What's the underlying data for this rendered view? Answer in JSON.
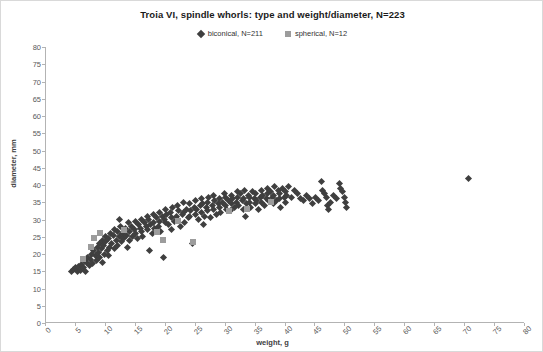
{
  "chart_data": {
    "type": "scatter",
    "title": "Troia VI, spindle whorls: type and weight/diameter, N=223",
    "xlabel": "weight, g",
    "ylabel": "diameter, mm",
    "xlim": [
      0,
      80
    ],
    "ylim": [
      0,
      80
    ],
    "xticks": [
      0,
      5,
      10,
      15,
      20,
      25,
      30,
      35,
      40,
      45,
      50,
      55,
      60,
      65,
      70,
      75,
      80
    ],
    "yticks": [
      0,
      5,
      10,
      15,
      20,
      25,
      30,
      35,
      40,
      45,
      50,
      55,
      60,
      65,
      70,
      75,
      80
    ],
    "grid": false,
    "legend_position": "top-center",
    "series": [
      {
        "name": "biconical, N=211",
        "marker": "diamond",
        "color": "#3f3f3f",
        "points": [
          [
            4.2,
            15.0
          ],
          [
            4.6,
            15.5
          ],
          [
            5.0,
            16.0
          ],
          [
            5.2,
            14.8
          ],
          [
            5.5,
            16.5
          ],
          [
            5.8,
            15.2
          ],
          [
            6.0,
            17.0
          ],
          [
            6.2,
            16.2
          ],
          [
            6.5,
            18.0
          ],
          [
            6.6,
            15.0
          ],
          [
            6.8,
            17.5
          ],
          [
            7.0,
            19.0
          ],
          [
            7.2,
            16.8
          ],
          [
            7.4,
            18.5
          ],
          [
            7.6,
            20.0
          ],
          [
            7.8,
            17.2
          ],
          [
            8.0,
            21.0
          ],
          [
            8.2,
            19.5
          ],
          [
            8.4,
            18.0
          ],
          [
            8.6,
            22.0
          ],
          [
            8.8,
            20.5
          ],
          [
            9.0,
            23.0
          ],
          [
            9.0,
            19.0
          ],
          [
            9.2,
            21.5
          ],
          [
            9.4,
            24.0
          ],
          [
            9.5,
            17.5
          ],
          [
            9.6,
            22.5
          ],
          [
            9.8,
            20.0
          ],
          [
            10.0,
            25.0
          ],
          [
            10.0,
            23.5
          ],
          [
            10.2,
            21.0
          ],
          [
            10.4,
            24.5
          ],
          [
            10.5,
            19.5
          ],
          [
            10.6,
            22.0
          ],
          [
            10.8,
            26.0
          ],
          [
            11.0,
            23.0
          ],
          [
            11.2,
            25.5
          ],
          [
            11.4,
            21.5
          ],
          [
            11.5,
            27.0
          ],
          [
            11.8,
            24.0
          ],
          [
            12.0,
            26.5
          ],
          [
            12.0,
            22.5
          ],
          [
            12.2,
            25.0
          ],
          [
            12.5,
            28.0
          ],
          [
            12.6,
            23.5
          ],
          [
            12.8,
            26.0
          ],
          [
            13.0,
            24.5
          ],
          [
            13.2,
            27.5
          ],
          [
            13.5,
            25.5
          ],
          [
            13.6,
            22.0
          ],
          [
            13.8,
            29.0
          ],
          [
            14.0,
            26.5
          ],
          [
            14.0,
            24.0
          ],
          [
            14.2,
            28.0
          ],
          [
            14.5,
            25.0
          ],
          [
            14.8,
            27.0
          ],
          [
            15.0,
            29.5
          ],
          [
            15.0,
            26.0
          ],
          [
            15.2,
            24.5
          ],
          [
            15.5,
            28.5
          ],
          [
            15.8,
            27.5
          ],
          [
            16.0,
            30.0
          ],
          [
            16.0,
            26.5
          ],
          [
            16.2,
            25.0
          ],
          [
            16.5,
            29.0
          ],
          [
            16.8,
            28.0
          ],
          [
            17.0,
            31.0
          ],
          [
            17.0,
            27.0
          ],
          [
            17.2,
            30.0
          ],
          [
            17.5,
            28.5
          ],
          [
            17.8,
            26.0
          ],
          [
            18.0,
            31.5
          ],
          [
            18.0,
            29.0
          ],
          [
            18.2,
            27.5
          ],
          [
            18.5,
            30.5
          ],
          [
            18.8,
            28.0
          ],
          [
            19.0,
            32.0
          ],
          [
            19.0,
            29.5
          ],
          [
            19.2,
            26.5
          ],
          [
            19.5,
            31.0
          ],
          [
            19.6,
            19.0
          ],
          [
            19.8,
            30.0
          ],
          [
            20.0,
            33.0
          ],
          [
            20.0,
            29.0
          ],
          [
            20.2,
            31.5
          ],
          [
            20.5,
            28.5
          ],
          [
            20.8,
            32.0
          ],
          [
            21.0,
            30.5
          ],
          [
            21.0,
            27.0
          ],
          [
            21.2,
            33.5
          ],
          [
            21.5,
            29.5
          ],
          [
            21.8,
            31.0
          ],
          [
            22.0,
            34.0
          ],
          [
            22.0,
            30.0
          ],
          [
            22.2,
            32.5
          ],
          [
            22.5,
            28.0
          ],
          [
            22.8,
            31.5
          ],
          [
            23.0,
            35.0
          ],
          [
            23.0,
            32.0
          ],
          [
            23.2,
            29.0
          ],
          [
            23.5,
            33.0
          ],
          [
            23.8,
            30.5
          ],
          [
            24.0,
            34.5
          ],
          [
            24.0,
            31.0
          ],
          [
            24.2,
            32.5
          ],
          [
            24.5,
            23.0
          ],
          [
            24.8,
            33.5
          ],
          [
            25.0,
            35.5
          ],
          [
            25.0,
            31.5
          ],
          [
            25.2,
            33.0
          ],
          [
            25.5,
            30.0
          ],
          [
            25.8,
            34.0
          ],
          [
            26.0,
            36.0
          ],
          [
            26.0,
            32.0
          ],
          [
            26.2,
            34.5
          ],
          [
            26.5,
            31.0
          ],
          [
            26.8,
            33.5
          ],
          [
            27.0,
            35.0
          ],
          [
            27.0,
            32.5
          ],
          [
            27.2,
            36.5
          ],
          [
            27.5,
            30.5
          ],
          [
            27.8,
            34.0
          ],
          [
            28.0,
            37.0
          ],
          [
            28.0,
            33.0
          ],
          [
            28.2,
            35.5
          ],
          [
            28.5,
            31.5
          ],
          [
            28.8,
            34.5
          ],
          [
            29.0,
            36.0
          ],
          [
            29.0,
            33.5
          ],
          [
            29.2,
            32.0
          ],
          [
            29.5,
            35.0
          ],
          [
            29.8,
            37.5
          ],
          [
            30.0,
            34.0
          ],
          [
            30.0,
            36.5
          ],
          [
            30.2,
            33.0
          ],
          [
            30.5,
            35.5
          ],
          [
            30.8,
            32.5
          ],
          [
            31.0,
            37.0
          ],
          [
            31.0,
            34.5
          ],
          [
            31.2,
            36.0
          ],
          [
            31.5,
            33.5
          ],
          [
            31.8,
            35.0
          ],
          [
            32.0,
            38.0
          ],
          [
            32.0,
            36.5
          ],
          [
            32.2,
            34.0
          ],
          [
            32.5,
            37.5
          ],
          [
            32.8,
            35.5
          ],
          [
            33.0,
            33.0
          ],
          [
            33.0,
            36.0
          ],
          [
            33.2,
            38.5
          ],
          [
            33.5,
            34.5
          ],
          [
            33.8,
            37.0
          ],
          [
            34.0,
            35.0
          ],
          [
            34.0,
            36.5
          ],
          [
            34.2,
            33.5
          ],
          [
            34.5,
            38.0
          ],
          [
            34.8,
            36.0
          ],
          [
            35.0,
            37.5
          ],
          [
            35.0,
            34.5
          ],
          [
            35.2,
            35.5
          ],
          [
            35.5,
            33.0
          ],
          [
            35.8,
            36.5
          ],
          [
            36.0,
            38.5
          ],
          [
            36.0,
            35.0
          ],
          [
            36.2,
            37.0
          ],
          [
            36.5,
            34.0
          ],
          [
            36.8,
            36.0
          ],
          [
            37.0,
            39.0
          ],
          [
            37.0,
            37.5
          ],
          [
            37.2,
            35.5
          ],
          [
            37.5,
            38.0
          ],
          [
            37.8,
            36.5
          ],
          [
            38.0,
            34.5
          ],
          [
            38.0,
            37.0
          ],
          [
            38.2,
            39.5
          ],
          [
            38.5,
            35.5
          ],
          [
            38.8,
            38.5
          ],
          [
            39.0,
            36.0
          ],
          [
            39.0,
            37.5
          ],
          [
            39.2,
            33.5
          ],
          [
            39.5,
            39.0
          ],
          [
            39.8,
            36.5
          ],
          [
            40.0,
            38.0
          ],
          [
            40.0,
            35.0
          ],
          [
            40.2,
            37.0
          ],
          [
            40.5,
            39.5
          ],
          [
            41.0,
            36.5
          ],
          [
            41.5,
            38.5
          ],
          [
            42.0,
            37.5
          ],
          [
            42.5,
            36.0
          ],
          [
            43.0,
            35.5
          ],
          [
            43.5,
            37.0
          ],
          [
            44.0,
            36.0
          ],
          [
            44.5,
            34.5
          ],
          [
            45.0,
            36.5
          ],
          [
            45.5,
            35.5
          ],
          [
            46.0,
            41.0
          ],
          [
            46.2,
            38.5
          ],
          [
            46.5,
            37.5
          ],
          [
            46.8,
            36.5
          ],
          [
            47.0,
            34.0
          ],
          [
            47.2,
            33.0
          ],
          [
            47.5,
            35.0
          ],
          [
            48.0,
            37.0
          ],
          [
            48.5,
            36.0
          ],
          [
            49.0,
            40.5
          ],
          [
            49.2,
            39.0
          ],
          [
            49.5,
            38.0
          ],
          [
            49.8,
            36.5
          ],
          [
            50.0,
            35.0
          ],
          [
            50.2,
            33.5
          ],
          [
            12.3,
            30.0
          ],
          [
            17.3,
            21.0
          ],
          [
            26.3,
            28.5
          ],
          [
            33.3,
            31.0
          ],
          [
            70.5,
            42.0
          ]
        ]
      },
      {
        "name": "spherical, N=12",
        "marker": "square",
        "color": "#9c9c9c",
        "points": [
          [
            6.2,
            18.5
          ],
          [
            7.5,
            22.0
          ],
          [
            8.0,
            24.5
          ],
          [
            9.0,
            26.0
          ],
          [
            13.0,
            27.0
          ],
          [
            18.5,
            26.5
          ],
          [
            19.5,
            24.0
          ],
          [
            22.0,
            29.5
          ],
          [
            24.5,
            23.5
          ],
          [
            30.5,
            32.5
          ],
          [
            33.5,
            33.0
          ],
          [
            37.5,
            35.0
          ]
        ]
      }
    ]
  }
}
